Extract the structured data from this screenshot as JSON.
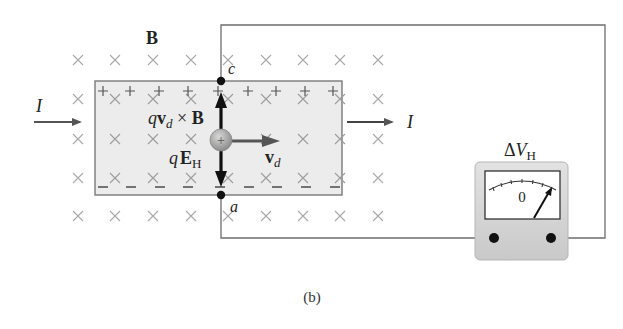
{
  "figure": {
    "caption": "(b)",
    "field_label": "B",
    "field_direction": "into page",
    "current_in_label": "I",
    "current_out_label": "I",
    "point_top_label": "c",
    "point_bottom_label": "a",
    "force_magnetic_label": {
      "q": "q",
      "v": "v",
      "sub": "d",
      "cross": " × ",
      "B": "B"
    },
    "force_electric_label": {
      "q": "q",
      "E": "E",
      "sub": "H"
    },
    "velocity_label": {
      "v": "v",
      "sub": "d"
    },
    "charge_symbol": "+",
    "top_edge_charge": "+",
    "bottom_edge_charge": "–",
    "meter": {
      "title": {
        "delta": "Δ",
        "V": "V",
        "sub": "H"
      },
      "scale_zero": "0"
    }
  },
  "colors": {
    "slab_fill": "#ececec",
    "slab_border": "#7a7a7a",
    "cross_mark": "#a3a3a3",
    "wire": "#6e6e6e",
    "arrow_dark": "#111111",
    "arrow_gray": "#555555",
    "particle_fill": "#a8a8a8",
    "meter_body": "#d6d6d6",
    "meter_face": "#ffffff",
    "text": "#222222"
  }
}
